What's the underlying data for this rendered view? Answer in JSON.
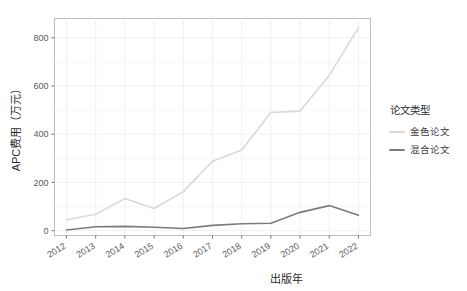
{
  "chart_data": {
    "type": "line",
    "title": "",
    "xlabel": "出版年",
    "ylabel": "APC费用（万元）",
    "x": [
      2012,
      2013,
      2014,
      2015,
      2016,
      2017,
      2018,
      2019,
      2020,
      2021,
      2022
    ],
    "categories": [
      "2012",
      "2013",
      "2014",
      "2015",
      "2016",
      "2017",
      "2018",
      "2019",
      "2020",
      "2021",
      "2022"
    ],
    "series": [
      {
        "name": "金色论文",
        "color": "#d9d9d9",
        "values": [
          45,
          68,
          133,
          92,
          162,
          288,
          335,
          490,
          496,
          645,
          842
        ]
      },
      {
        "name": "混合论文",
        "color": "#7b7b7b",
        "values": [
          3,
          16,
          18,
          14,
          9,
          22,
          29,
          31,
          76,
          104,
          64
        ]
      }
    ],
    "ylim": [
      -20,
      880
    ],
    "yticks": [
      0,
      200,
      400,
      600,
      800
    ],
    "ytick_labels": [
      "0",
      "200",
      "400",
      "600",
      "800"
    ],
    "xtick_labels": [
      "2012",
      "2013",
      "2014",
      "2015",
      "2016",
      "2017",
      "2018",
      "2019",
      "2020",
      "2021",
      "2022"
    ],
    "grid": true,
    "grid_color": "#f0f0f0",
    "panel_border_color": "#bfbfbf",
    "panel_background": "#ffffff",
    "legend_position": "right",
    "legend": {
      "title": "论文类型",
      "entries": [
        {
          "label": "金色论文",
          "color": "#d9d9d9"
        },
        {
          "label": "混合论文",
          "color": "#7b7b7b"
        }
      ]
    }
  }
}
